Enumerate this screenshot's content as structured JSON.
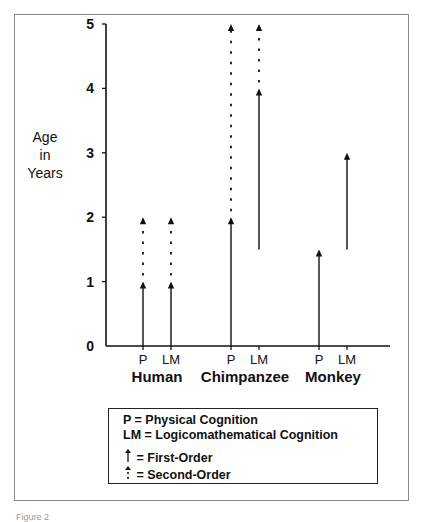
{
  "chart_data": {
    "type": "range-arrow",
    "title": "",
    "ylabel": [
      "Age",
      "in",
      "Years"
    ],
    "ylim": [
      0,
      5
    ],
    "yticks": [
      0,
      1,
      2,
      3,
      4,
      5
    ],
    "grid": false,
    "groups": [
      {
        "name": "Human",
        "bars": [
          {
            "label": "P",
            "first_order": [
              0,
              1
            ],
            "second_order": [
              1,
              2
            ]
          },
          {
            "label": "LM",
            "first_order": [
              0,
              1
            ],
            "second_order": [
              1,
              2
            ]
          }
        ]
      },
      {
        "name": "Chimpanzee",
        "bars": [
          {
            "label": "P",
            "first_order": [
              0,
              2
            ],
            "second_order": [
              2,
              5
            ]
          },
          {
            "label": "LM",
            "first_order": [
              1.5,
              4
            ],
            "second_order": [
              4,
              5
            ]
          }
        ]
      },
      {
        "name": "Monkey",
        "bars": [
          {
            "label": "P",
            "first_order": [
              0,
              1.5
            ],
            "second_order": null
          },
          {
            "label": "LM",
            "first_order": [
              1.5,
              3
            ],
            "second_order": null
          }
        ]
      }
    ],
    "legend": {
      "placement": "bottom",
      "entries": [
        {
          "key": "P",
          "text": "P = Physical Cognition"
        },
        {
          "key": "LM",
          "text": "LM = Logicomathematical Cognition"
        },
        {
          "key": "first-order",
          "icon": "solid-arrow-icon",
          "text": "= First-Order"
        },
        {
          "key": "second-order",
          "icon": "dotted-arrow-icon",
          "text": "= Second-Order"
        }
      ]
    }
  },
  "caption": "Figure 2"
}
